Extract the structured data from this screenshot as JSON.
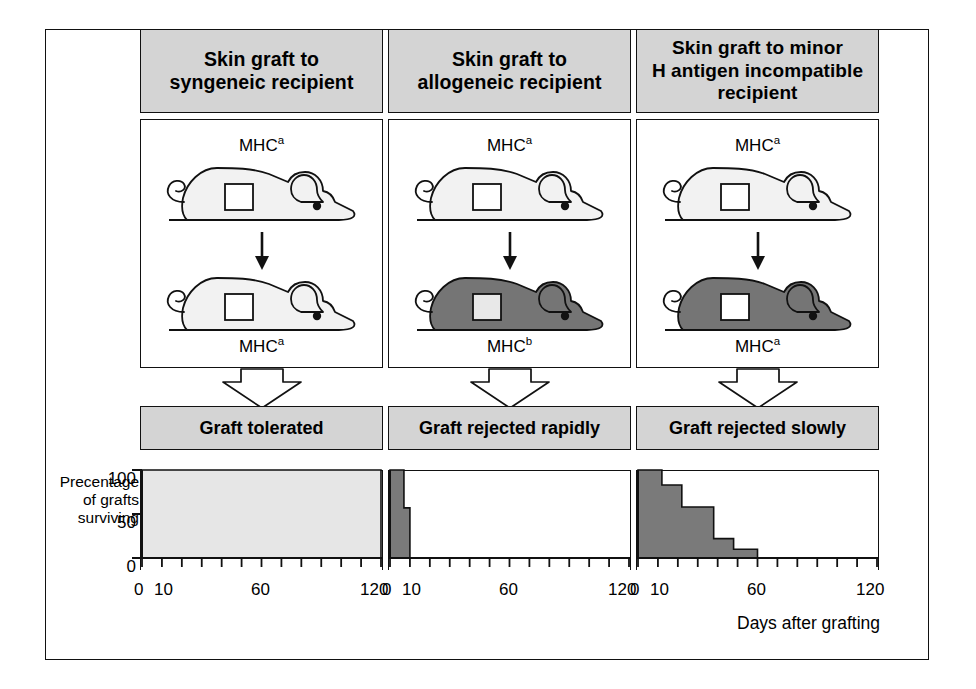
{
  "figure": {
    "columns": [
      {
        "id": "syngeneic",
        "header": "Skin graft to\nsyngeneic recipient",
        "header_lines": [
          "Skin graft to",
          "syngeneic recipient"
        ],
        "donor_label": "MHC",
        "donor_superscript": "a",
        "recipient_label": "MHC",
        "recipient_superscript": "a",
        "donor_fill": "#f2f2f2",
        "recipient_fill": "#f2f2f2",
        "graft_square_fill": "#ffffff",
        "result": "Graft tolerated"
      },
      {
        "id": "allogeneic",
        "header": "Skin graft to\nallogeneic recipient",
        "header_lines": [
          "Skin graft to",
          "allogeneic recipient"
        ],
        "donor_label": "MHC",
        "donor_superscript": "a",
        "recipient_label": "MHC",
        "recipient_superscript": "b",
        "donor_fill": "#f2f2f2",
        "recipient_fill": "#757575",
        "graft_square_fill": "#e8e8e8",
        "result": "Graft rejected rapidly"
      },
      {
        "id": "minor-h",
        "header": "Skin graft to minor\nH antigen incompatible\nrecipient",
        "header_lines": [
          "Skin graft to minor",
          "H antigen incompatible",
          "recipient"
        ],
        "donor_label": "MHC",
        "donor_superscript": "a",
        "recipient_label": "MHC",
        "recipient_superscript": "a",
        "donor_fill": "#f2f2f2",
        "recipient_fill": "#757575",
        "graft_square_fill": "#ffffff",
        "result": "Graft rejected slowly"
      }
    ],
    "axis": {
      "y_label_lines": [
        "Precentage",
        "of grafts",
        "surviving"
      ],
      "y_ticks": [
        "100",
        "50",
        "0"
      ],
      "y_tick_values": [
        100,
        50,
        0
      ],
      "x_title": "Days after grafting",
      "x_tick_labels": [
        "0",
        "10",
        "60",
        "120"
      ],
      "x_tick_values": [
        0,
        10,
        60,
        120
      ],
      "x_minor_step": 10
    },
    "colors": {
      "panel_gray": "#d4d4d4",
      "light_curve_fill": "#e6e6e6",
      "dark_curve_fill": "#7a7a7a",
      "outline": "#111111",
      "mouse_light": "#f2f2f2",
      "mouse_dark": "#757575"
    }
  },
  "chart_data": [
    {
      "type": "area",
      "id": "syngeneic-survival",
      "title": "Graft tolerated",
      "xlabel": "Days after grafting",
      "ylabel": "Precentage of grafts surviving",
      "xlim": [
        0,
        120
      ],
      "ylim": [
        0,
        100
      ],
      "fill": "#e6e6e6",
      "step_x": [
        0,
        120
      ],
      "step_y": [
        100,
        100
      ],
      "note": "100% survival maintained through 120 days"
    },
    {
      "type": "area",
      "id": "allogeneic-survival",
      "title": "Graft rejected rapidly",
      "xlabel": "Days after grafting",
      "ylabel": "Precentage of grafts surviving",
      "xlim": [
        0,
        120
      ],
      "ylim": [
        0,
        100
      ],
      "fill": "#7a7a7a",
      "step_x": [
        0,
        7,
        7,
        10,
        10,
        120
      ],
      "step_y": [
        100,
        100,
        57,
        57,
        0,
        0
      ],
      "note": "All grafts rejected by about 10 days"
    },
    {
      "type": "area",
      "id": "minor-h-survival",
      "title": "Graft rejected slowly",
      "xlabel": "Days after grafting",
      "ylabel": "Precentage of grafts surviving",
      "xlim": [
        0,
        120
      ],
      "ylim": [
        0,
        100
      ],
      "fill": "#7a7a7a",
      "step_x": [
        0,
        12,
        12,
        22,
        22,
        38,
        38,
        48,
        48,
        60,
        60,
        120
      ],
      "step_y": [
        100,
        100,
        83,
        83,
        58,
        58,
        22,
        22,
        10,
        10,
        0,
        0
      ],
      "note": "Gradual rejection completed by about 60 days"
    }
  ]
}
